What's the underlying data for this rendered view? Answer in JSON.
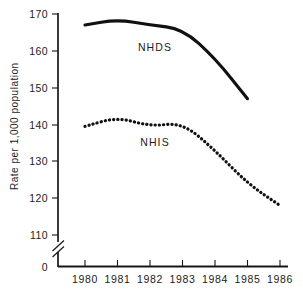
{
  "chart_data": {
    "type": "line",
    "title": "",
    "xlabel": "",
    "ylabel": "Rate per 1,000 population",
    "categories": [
      "1980",
      "1981",
      "1982",
      "1983",
      "1984",
      "1985",
      "1986"
    ],
    "x": [
      1980,
      1981,
      1982,
      1983,
      1984,
      1985,
      1986
    ],
    "series": [
      {
        "name": "NHDS",
        "style": "solid",
        "values": [
          167,
          168.5,
          167,
          166,
          158,
          147,
          null
        ]
      },
      {
        "name": "NHIS",
        "style": "dotted",
        "values": [
          139.5,
          142,
          139.5,
          140.5,
          133,
          124,
          118
        ]
      }
    ],
    "ylim": [
      110,
      170
    ],
    "yticks": [
      "170",
      "160",
      "150",
      "140",
      "130",
      "120",
      "110",
      "0"
    ],
    "ytick_values": [
      170,
      160,
      150,
      140,
      130,
      120,
      110,
      0
    ],
    "xticks": [
      "1980",
      "1981",
      "1982",
      "1983",
      "1984",
      "1985",
      "1986"
    ],
    "axis_break": true,
    "axis_break_between": [
      0,
      110
    ],
    "grid": false,
    "legend": "inline-annotations",
    "annotations": [
      {
        "text": "NHDS",
        "near_series": "NHDS",
        "x": 1982.3,
        "y": 163.2
      },
      {
        "text": "NHIS",
        "near_series": "NHIS",
        "x": 1982.3,
        "y": 135.0
      }
    ],
    "colors": {
      "series_nhds": "#111111",
      "series_nhis": "#111111",
      "axis": "#171717",
      "background": "#ffffff"
    }
  }
}
